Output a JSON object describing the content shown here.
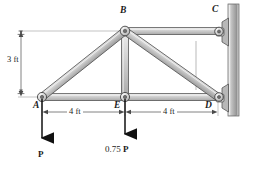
{
  "figure": {
    "colors": {
      "member_fill": "#c9c9c9",
      "member_fill_light": "#e4e4e4",
      "member_outline": "#4a4a4a",
      "wall_fill": "#b4b4b4",
      "wall_outline": "#4d4d4d",
      "dimension_line": "#6f6f6f",
      "force_arrow": "#111111",
      "pin_fill": "#d8d8d8",
      "background": "#ffffff"
    },
    "joints": [
      {
        "id": "A",
        "label": "A",
        "x": 42,
        "y": 97,
        "label_x": 33,
        "label_y": 108,
        "type": "pin"
      },
      {
        "id": "B",
        "label": "B",
        "x": 125,
        "y": 31,
        "label_x": 121,
        "label_y": 14,
        "type": "pin"
      },
      {
        "id": "C",
        "label": "C",
        "x": 218,
        "y": 31,
        "label_x": 213,
        "label_y": 13,
        "type": "wall-pin"
      },
      {
        "id": "D",
        "label": "D",
        "x": 218,
        "y": 97,
        "label_x": 206,
        "label_y": 109,
        "type": "wall-pin"
      },
      {
        "id": "E",
        "label": "E",
        "x": 125,
        "y": 97,
        "label_x": 115,
        "label_y": 109,
        "type": "pin"
      }
    ],
    "members": [
      {
        "id": "AB",
        "from": "A",
        "to": "B"
      },
      {
        "id": "BC",
        "from": "B",
        "to": "C"
      },
      {
        "id": "AE",
        "from": "A",
        "to": "E"
      },
      {
        "id": "ED",
        "from": "E",
        "to": "D"
      },
      {
        "id": "BE",
        "from": "B",
        "to": "E"
      },
      {
        "id": "BD",
        "from": "B",
        "to": "D"
      }
    ],
    "dimensions": [
      {
        "id": "height",
        "label": "3 ft",
        "value": 3,
        "unit": "ft",
        "orientation": "vertical",
        "label_x": 11,
        "label_y": 59
      },
      {
        "id": "span-left",
        "label": "4 ft",
        "value": 4,
        "unit": "ft",
        "orientation": "horizontal",
        "label_x": 68,
        "label_y": 113
      },
      {
        "id": "span-right",
        "label": "4 ft",
        "value": 4,
        "unit": "ft",
        "orientation": "horizontal",
        "label_x": 162,
        "label_y": 113
      }
    ],
    "loads": [
      {
        "id": "load-A",
        "label": "P",
        "magnitude": "P",
        "at_joint": "A",
        "direction": "down",
        "x": 42,
        "label_x": 38,
        "label_y": 155
      },
      {
        "id": "load-E",
        "label": "0.75 P",
        "number": "0.75 ",
        "symbol": "P",
        "at_joint": "E",
        "direction": "down",
        "x": 125,
        "label_x": 108,
        "label_y": 151
      }
    ],
    "wall": {
      "id": "support-wall",
      "x": 228,
      "y_top": 4,
      "y_bottom": 116
    }
  }
}
